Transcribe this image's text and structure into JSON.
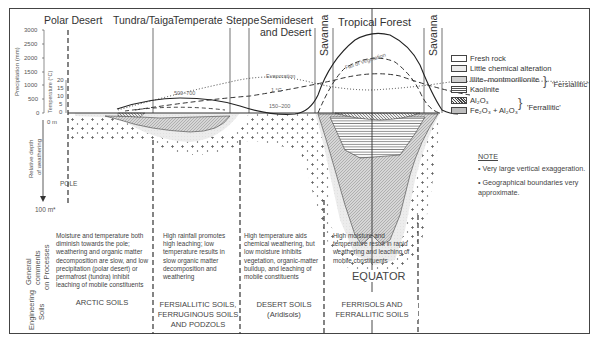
{
  "zones": {
    "polar": "Polar Desert",
    "tundra": "Tundra/Taiga",
    "temperate": "Temperate",
    "steppe": "Steppe",
    "semidesert_line1": "Semidesert",
    "semidesert_line2": "and Desert",
    "savanna_left": "Savanna",
    "tropical": "Tropical Forest",
    "savanna_right": "Savanna"
  },
  "axes": {
    "precip_label": "Precipitation (mm)",
    "precip_ticks": [
      "3000",
      "2500",
      "2000",
      "1500",
      "1000",
      "500",
      "0"
    ],
    "temp_label": "Temperature (°C)",
    "temp_ticks": [
      "20",
      "15",
      "10",
      "5",
      "0"
    ],
    "zero_depth": "0 m",
    "depth_label_line1": "Relative depth",
    "depth_label_line2": "of weathering",
    "depth_bottom": "100 m*"
  },
  "curve_labels": {
    "evaporation": "Evaporation",
    "one_degree": "1 °C",
    "fall_of_vegetation": "Fall of Vegetation",
    "precip_temperate": "500–700",
    "precip_desert": "150–200"
  },
  "markers": {
    "pole": "POLE",
    "equator": "EQUATOR"
  },
  "legend": {
    "items": [
      {
        "label": "Fresh rock",
        "pattern": "fresh-rock"
      },
      {
        "label": "Little chemical alteration",
        "pattern": "little-alteration"
      },
      {
        "label": "Illite–montmorillonite",
        "pattern": "illite"
      },
      {
        "label": "Kaolinite",
        "pattern": "kaolinite"
      },
      {
        "label": "Al₂O₃",
        "pattern": "al2o3"
      },
      {
        "label": "Fe₂O₃ + Al₂O₃",
        "pattern": "fe2o3"
      }
    ],
    "group_fersiallitic": "'Fersiallitic'",
    "group_ferrallitic": "'Ferrallitic'"
  },
  "note": {
    "title": "NOTE",
    "items": [
      "Very large vertical exaggeration.",
      "Geographical boundaries very approximate."
    ]
  },
  "rows": {
    "comments_label_line1": "General",
    "comments_label_line2": "comments",
    "comments_label_line3": "on Processes",
    "soils_label_line1": "Engineering",
    "soils_label_line2": "Soils"
  },
  "comments": {
    "arctic": "Moisture and temperature both diminish towards the pole; weathering and organic matter decomposition are slow, and low precipitation (polar desert) or permafrost (tundra) inhibit leaching of mobile constituents",
    "temperate": "High rainfall promotes high leaching; low temperature results in slow organic matter decomposition and weathering",
    "desert": "High temperature aids chemical weathering, but low moisture inhibits vegetation, organic-matter buildup, and leaching of mobile constituents",
    "tropical": "High moisture and temperature result in rapid weathering and leaching of mobile constituents"
  },
  "soils": {
    "arctic": "ARCTIC SOILS",
    "temperate_line1": "FERSIALLITIC SOILS,",
    "temperate_line2": "FERRUGINOUS SOILS",
    "temperate_line3": "AND PODZOLS",
    "desert_line1": "DESERT SOILS",
    "desert_line2": "(Aridisols)",
    "tropical_line1": "FERRISOLS AND",
    "tropical_line2": "FERRALLITIC SOILS"
  },
  "colors": {
    "line": "#333333",
    "frame": "#444444",
    "stipple": "#555555",
    "light_fill": "#e4e4e4",
    "medium_fill": "#bdbdbd"
  }
}
